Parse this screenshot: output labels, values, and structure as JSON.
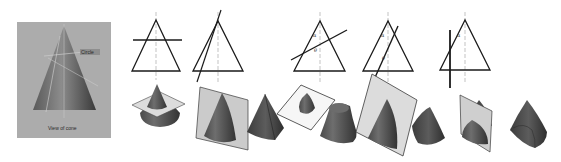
{
  "diagram": {
    "colors": {
      "background": "#ffffff",
      "photo_bg": "#a9a9a9",
      "photo_cone_dark": "#4a4a4a",
      "photo_cone_light": "#8a8a8a",
      "line": "#1a1a1a",
      "axis": "#9a9a9a",
      "solid_dark": "#3e3e3e",
      "solid_mid": "#5a5a5a",
      "solid_light": "#7a7a7a",
      "plane_fill": "#cfcfcf",
      "plane_fill_white": "#f4f4f4",
      "plane_stroke": "#444444"
    },
    "photo": {
      "x": 17,
      "y": 22,
      "w": 94,
      "h": 116,
      "labels": {
        "circle": "Circle",
        "caption": "View of cone"
      }
    },
    "angle_symbols": {
      "alpha": "α",
      "theta": "θ"
    },
    "elevations": [
      {
        "id": "circle",
        "apex": [
          156,
          20
        ],
        "base_l": [
          132,
          71
        ],
        "base_r": [
          180,
          71
        ],
        "cut": [
          [
            133,
            40
          ],
          [
            182,
            40
          ]
        ],
        "cut_width": 1.6
      },
      {
        "id": "ellipse-steep",
        "apex": [
          218,
          21
        ],
        "base_l": [
          193,
          71
        ],
        "base_r": [
          243,
          71
        ],
        "cut": [
          [
            221,
            10
          ],
          [
            197,
            82
          ]
        ],
        "cut_width": 1.2
      },
      {
        "id": "ellipse",
        "apex": [
          320,
          21
        ],
        "base_l": [
          294,
          71
        ],
        "base_r": [
          345,
          71
        ],
        "cut": [
          [
            291,
            60
          ],
          [
            347,
            30
          ]
        ],
        "cut_width": 1.4,
        "angles": [
          "α",
          "θ"
        ]
      },
      {
        "id": "parabola",
        "apex": [
          388,
          21
        ],
        "base_l": [
          363,
          71
        ],
        "base_r": [
          413,
          71
        ],
        "cut": [
          [
            398,
            26
          ],
          [
            373,
            82
          ]
        ],
        "cut_width": 1.4,
        "angles": [
          "α",
          "θ"
        ]
      },
      {
        "id": "hyperbola",
        "apex": [
          465,
          20
        ],
        "base_l": [
          440,
          70
        ],
        "base_r": [
          490,
          70
        ],
        "cut": [
          [
            450,
            30
          ],
          [
            450,
            88
          ]
        ],
        "cut_width": 1.8,
        "angles": [
          "α"
        ]
      }
    ],
    "solids": [
      {
        "id": "circle-section-cone",
        "label": "Cone with horizontal cutting plane"
      },
      {
        "id": "ellipse-plane-cone",
        "label": "Cone with inclined cutting plane"
      },
      {
        "id": "pyramid-like-cone",
        "label": "Sectioned cone (ellipse)"
      },
      {
        "id": "ellipse-section-piece",
        "label": "Elliptical section on plane"
      },
      {
        "id": "truncated-cone",
        "label": "Frustum"
      },
      {
        "id": "parabola-plane-cone",
        "label": "Cone with parabolic cutting plane"
      },
      {
        "id": "parabola-piece",
        "label": "Parabolic section solid"
      },
      {
        "id": "hyperbola-plane-cone",
        "label": "Cone with vertical cutting plane"
      },
      {
        "id": "hyperbola-piece",
        "label": "Hyperbolic section solid"
      }
    ]
  }
}
